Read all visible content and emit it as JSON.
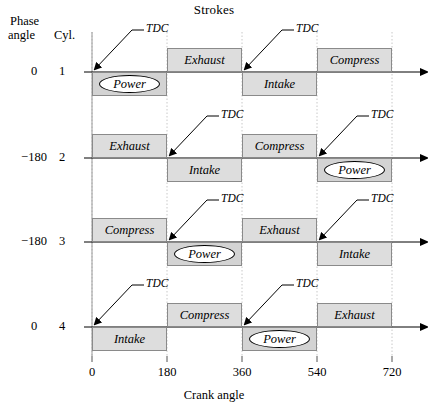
{
  "title": "Strokes",
  "axes": {
    "x_title": "Crank angle",
    "x_ticks": [
      "0",
      "180",
      "360",
      "540",
      "720"
    ],
    "header_phase_line1": "Phase",
    "header_phase_line2": "angle",
    "header_cyl": "Cyl.",
    "tdc_label": "TDC"
  },
  "chart_data": {
    "type": "bar",
    "title": "Strokes",
    "xlabel": "Crank angle",
    "ylabel": "Cyl.",
    "xlim": [
      0,
      720
    ],
    "x_ticks": [
      0,
      180,
      360,
      540,
      720
    ],
    "grid": true,
    "legend": "none",
    "rows": [
      {
        "cylinder": "1",
        "phase_angle": "0",
        "strokes": [
          {
            "label": "Power",
            "start": 0,
            "end": 180,
            "side": "below",
            "highlight": true
          },
          {
            "label": "Exhaust",
            "start": 180,
            "end": 360,
            "side": "above",
            "highlight": false
          },
          {
            "label": "Intake",
            "start": 360,
            "end": 540,
            "side": "below",
            "highlight": false
          },
          {
            "label": "Compress",
            "start": 540,
            "end": 720,
            "side": "above",
            "highlight": false
          }
        ],
        "tdc_marks": [
          0,
          360
        ]
      },
      {
        "cylinder": "2",
        "phase_angle": "−180",
        "strokes": [
          {
            "label": "Exhaust",
            "start": 0,
            "end": 180,
            "side": "above",
            "highlight": false
          },
          {
            "label": "Intake",
            "start": 180,
            "end": 360,
            "side": "below",
            "highlight": false
          },
          {
            "label": "Compress",
            "start": 360,
            "end": 540,
            "side": "above",
            "highlight": false
          },
          {
            "label": "Power",
            "start": 540,
            "end": 720,
            "side": "below",
            "highlight": true
          }
        ],
        "tdc_marks": [
          180,
          540
        ]
      },
      {
        "cylinder": "3",
        "phase_angle": "−180",
        "strokes": [
          {
            "label": "Compress",
            "start": 0,
            "end": 180,
            "side": "above",
            "highlight": false
          },
          {
            "label": "Power",
            "start": 180,
            "end": 360,
            "side": "below",
            "highlight": true
          },
          {
            "label": "Exhaust",
            "start": 360,
            "end": 540,
            "side": "above",
            "highlight": false
          },
          {
            "label": "Intake",
            "start": 540,
            "end": 720,
            "side": "below",
            "highlight": false
          }
        ],
        "tdc_marks": [
          180,
          540
        ]
      },
      {
        "cylinder": "4",
        "phase_angle": "0",
        "strokes": [
          {
            "label": "Intake",
            "start": 0,
            "end": 180,
            "side": "below",
            "highlight": false
          },
          {
            "label": "Compress",
            "start": 180,
            "end": 360,
            "side": "above",
            "highlight": false
          },
          {
            "label": "Power",
            "start": 360,
            "end": 540,
            "side": "below",
            "highlight": true
          },
          {
            "label": "Exhaust",
            "start": 540,
            "end": 720,
            "side": "above",
            "highlight": false
          }
        ],
        "tdc_marks": [
          0,
          360
        ]
      }
    ]
  }
}
